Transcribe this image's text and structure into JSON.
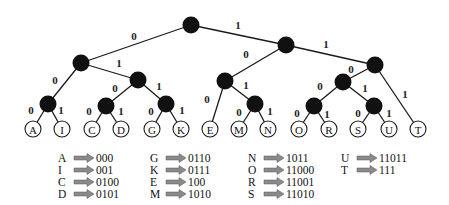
{
  "diagram": {
    "colors": {
      "internal_node": "#111111",
      "leaf_fill": "#ffffff",
      "edge": "#1a1a1a",
      "arrow": "#8a8a8a"
    },
    "internal_nodes": [
      {
        "id": "root",
        "x": 191,
        "y": 25
      },
      {
        "id": "n0",
        "x": 81,
        "y": 63
      },
      {
        "id": "n1",
        "x": 286,
        "y": 45
      },
      {
        "id": "n00",
        "x": 48,
        "y": 104
      },
      {
        "id": "n01",
        "x": 138,
        "y": 80
      },
      {
        "id": "n010",
        "x": 106,
        "y": 106
      },
      {
        "id": "n011",
        "x": 166,
        "y": 104
      },
      {
        "id": "n10",
        "x": 225,
        "y": 81
      },
      {
        "id": "n101",
        "x": 255,
        "y": 104
      },
      {
        "id": "n11",
        "x": 375,
        "y": 65
      },
      {
        "id": "n110",
        "x": 343,
        "y": 82
      },
      {
        "id": "n1100",
        "x": 314,
        "y": 106
      },
      {
        "id": "n1101",
        "x": 374,
        "y": 106
      }
    ],
    "leaves": [
      {
        "label": "A",
        "x": 33,
        "y": 129
      },
      {
        "label": "I",
        "x": 62,
        "y": 129
      },
      {
        "label": "C",
        "x": 92,
        "y": 129
      },
      {
        "label": "D",
        "x": 121,
        "y": 129
      },
      {
        "label": "G",
        "x": 152,
        "y": 129
      },
      {
        "label": "K",
        "x": 181,
        "y": 129
      },
      {
        "label": "E",
        "x": 210,
        "y": 129
      },
      {
        "label": "M",
        "x": 239,
        "y": 129
      },
      {
        "label": "N",
        "x": 268,
        "y": 129
      },
      {
        "label": "O",
        "x": 299,
        "y": 129
      },
      {
        "label": "R",
        "x": 329,
        "y": 129
      },
      {
        "label": "S",
        "x": 358,
        "y": 129
      },
      {
        "label": "U",
        "x": 389,
        "y": 129
      },
      {
        "label": "T",
        "x": 418,
        "y": 129
      }
    ],
    "edges": [
      {
        "from": [
          191,
          25
        ],
        "to": [
          81,
          63
        ],
        "bit": "0",
        "lx": 134,
        "ly": 36
      },
      {
        "from": [
          191,
          25
        ],
        "to": [
          286,
          45
        ],
        "bit": "1",
        "lx": 238,
        "ly": 25
      },
      {
        "from": [
          81,
          63
        ],
        "to": [
          48,
          104
        ],
        "bit": "0",
        "lx": 55,
        "ly": 80
      },
      {
        "from": [
          81,
          63
        ],
        "to": [
          138,
          80
        ],
        "bit": "1",
        "lx": 119,
        "ly": 63
      },
      {
        "from": [
          48,
          104
        ],
        "to": [
          33,
          129
        ],
        "bit": "0",
        "lx": 31,
        "ly": 110
      },
      {
        "from": [
          48,
          104
        ],
        "to": [
          62,
          129
        ],
        "bit": "1",
        "lx": 61,
        "ly": 110
      },
      {
        "from": [
          138,
          80
        ],
        "to": [
          106,
          106
        ],
        "bit": "0",
        "lx": 115,
        "ly": 88
      },
      {
        "from": [
          138,
          80
        ],
        "to": [
          166,
          104
        ],
        "bit": "1",
        "lx": 159,
        "ly": 86
      },
      {
        "from": [
          106,
          106
        ],
        "to": [
          92,
          129
        ],
        "bit": "0",
        "lx": 89,
        "ly": 111
      },
      {
        "from": [
          106,
          106
        ],
        "to": [
          121,
          129
        ],
        "bit": "1",
        "lx": 121,
        "ly": 111
      },
      {
        "from": [
          166,
          104
        ],
        "to": [
          152,
          129
        ],
        "bit": "0",
        "lx": 151,
        "ly": 111
      },
      {
        "from": [
          166,
          104
        ],
        "to": [
          181,
          129
        ],
        "bit": "1",
        "lx": 182,
        "ly": 110
      },
      {
        "from": [
          286,
          45
        ],
        "to": [
          225,
          81
        ],
        "bit": "0",
        "lx": 246,
        "ly": 54
      },
      {
        "from": [
          286,
          45
        ],
        "to": [
          375,
          65
        ],
        "bit": "1",
        "lx": 326,
        "ly": 44
      },
      {
        "from": [
          225,
          81
        ],
        "to": [
          210,
          129
        ],
        "bit": "0",
        "lx": 207,
        "ly": 99
      },
      {
        "from": [
          225,
          81
        ],
        "to": [
          255,
          104
        ],
        "bit": "1",
        "lx": 246,
        "ly": 85
      },
      {
        "from": [
          255,
          104
        ],
        "to": [
          239,
          129
        ],
        "bit": "0",
        "lx": 239,
        "ly": 112
      },
      {
        "from": [
          255,
          104
        ],
        "to": [
          268,
          129
        ],
        "bit": "1",
        "lx": 270,
        "ly": 111
      },
      {
        "from": [
          375,
          65
        ],
        "to": [
          343,
          82
        ],
        "bit": "0",
        "lx": 351,
        "ly": 69
      },
      {
        "from": [
          375,
          65
        ],
        "to": [
          418,
          129
        ],
        "bit": "1",
        "lx": 405,
        "ly": 94
      },
      {
        "from": [
          343,
          82
        ],
        "to": [
          314,
          106
        ],
        "bit": "0",
        "lx": 320,
        "ly": 86
      },
      {
        "from": [
          343,
          82
        ],
        "to": [
          374,
          106
        ],
        "bit": "1",
        "lx": 365,
        "ly": 88
      },
      {
        "from": [
          314,
          106
        ],
        "to": [
          299,
          129
        ],
        "bit": "0",
        "lx": 297,
        "ly": 113
      },
      {
        "from": [
          314,
          106
        ],
        "to": [
          329,
          129
        ],
        "bit": "1",
        "lx": 327,
        "ly": 114
      },
      {
        "from": [
          374,
          106
        ],
        "to": [
          358,
          129
        ],
        "bit": "0",
        "lx": 358,
        "ly": 113
      },
      {
        "from": [
          374,
          106
        ],
        "to": [
          389,
          129
        ],
        "bit": "1",
        "lx": 389,
        "ly": 113
      }
    ],
    "code_table": {
      "columns": [
        {
          "x": 58,
          "rows": [
            {
              "letter": "A",
              "code": "000"
            },
            {
              "letter": "I",
              "code": "001"
            },
            {
              "letter": "C",
              "code": "0100"
            },
            {
              "letter": "D",
              "code": "0101"
            }
          ]
        },
        {
          "x": 150,
          "rows": [
            {
              "letter": "G",
              "code": "0110"
            },
            {
              "letter": "K",
              "code": "0111"
            },
            {
              "letter": "E",
              "code": "100"
            },
            {
              "letter": "M",
              "code": "1010"
            }
          ]
        },
        {
          "x": 248,
          "rows": [
            {
              "letter": "N",
              "code": "1011"
            },
            {
              "letter": "O",
              "code": "11000"
            },
            {
              "letter": "R",
              "code": "11001"
            },
            {
              "letter": "S",
              "code": "11010"
            }
          ]
        },
        {
          "x": 341,
          "rows": [
            {
              "letter": "U",
              "code": "11011"
            },
            {
              "letter": "T",
              "code": "111"
            }
          ]
        }
      ],
      "top": 152
    }
  }
}
